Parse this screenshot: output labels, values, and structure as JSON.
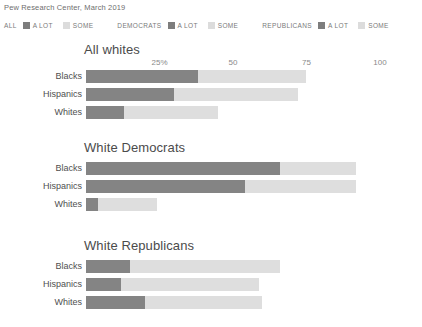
{
  "source": "Pew Research Center, March 2019",
  "legend": {
    "groups": [
      {
        "title": "ALL",
        "keys": [
          {
            "label": "A LOT",
            "swatch": "dark",
            "color": "#7d7d7d"
          },
          {
            "label": "SOME",
            "swatch": "light",
            "color": "#dcdcdc"
          }
        ]
      },
      {
        "title": "DEMOCRATS",
        "keys": [
          {
            "label": "A LOT",
            "swatch": "dark",
            "color": "#7d7d7d"
          },
          {
            "label": "SOME",
            "swatch": "light",
            "color": "#dcdcdc"
          }
        ]
      },
      {
        "title": "REPUBLICANS",
        "keys": [
          {
            "label": "A LOT",
            "swatch": "dark",
            "color": "#7d7d7d"
          },
          {
            "label": "SOME",
            "swatch": "light",
            "color": "#dcdcdc"
          }
        ]
      }
    ]
  },
  "chart_data": {
    "type": "bar",
    "title": "Pew Research Center, March 2019",
    "subtype": "stacked-horizontal-bar",
    "xlabel": "",
    "ylabel": "",
    "xlim": [
      0,
      100
    ],
    "grid": false,
    "legend_position": "top",
    "categories": [
      "Blacks",
      "Hispanics",
      "Whites"
    ],
    "series": [
      {
        "name": "A LOT",
        "color": "#848484"
      },
      {
        "name": "SOME",
        "color": "#dedede"
      }
    ],
    "tick_labels": [
      "25%",
      "50",
      "75",
      "100"
    ],
    "tick_values": [
      25,
      50,
      75,
      100
    ],
    "panels": [
      {
        "title": "All whites",
        "show_axis": true,
        "rows": [
          {
            "category": "Blacks",
            "a_lot": 38,
            "some": 37,
            "total": 75
          },
          {
            "category": "Hispanics",
            "a_lot": 30,
            "some": 42,
            "total": 72
          },
          {
            "category": "Whites",
            "a_lot": 13,
            "some": 32,
            "total": 45
          }
        ]
      },
      {
        "title": "White Democrats",
        "show_axis": false,
        "rows": [
          {
            "category": "Blacks",
            "a_lot": 66,
            "some": 26,
            "total": 92
          },
          {
            "category": "Hispanics",
            "a_lot": 54,
            "some": 38,
            "total": 92
          },
          {
            "category": "Whites",
            "a_lot": 4,
            "some": 20,
            "total": 24
          }
        ]
      },
      {
        "title": "White Republicans",
        "show_axis": false,
        "rows": [
          {
            "category": "Blacks",
            "a_lot": 15,
            "some": 51,
            "total": 66
          },
          {
            "category": "Hispanics",
            "a_lot": 12,
            "some": 47,
            "total": 59
          },
          {
            "category": "Whites",
            "a_lot": 20,
            "some": 40,
            "total": 60
          }
        ]
      }
    ]
  }
}
